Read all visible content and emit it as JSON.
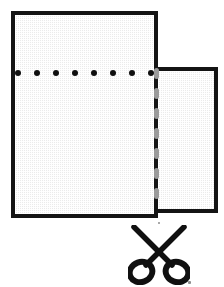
{
  "diagram": {
    "background_color": "#ffffff"
  },
  "sheets": [
    {
      "name": "main-sheet",
      "label": "Main grid sheet",
      "fill_color": "#ebebeb",
      "border_color": "#141414",
      "border_width_px": 4,
      "x": 11,
      "y": 11,
      "width": 147,
      "height": 207
    },
    {
      "name": "tear-off-sheet",
      "label": "Tear-off strip sheet",
      "fill_color": "#ebebeb",
      "border_color": "#141414",
      "border_width_px": 4,
      "x": 158,
      "y": 67,
      "width": 60,
      "height": 146
    }
  ],
  "holes": {
    "name": "punched-hole-row",
    "label": "Row of punched holes",
    "count": 8,
    "color": "#101010",
    "diameter_px": 6,
    "row_y": 73,
    "items": [
      {
        "index": 1,
        "cx": 18
      },
      {
        "index": 2,
        "cx": 37
      },
      {
        "index": 3,
        "cx": 56
      },
      {
        "index": 4,
        "cx": 75
      },
      {
        "index": 5,
        "cx": 94
      },
      {
        "index": 6,
        "cx": 113
      },
      {
        "index": 7,
        "cx": 132
      },
      {
        "index": 8,
        "cx": 151
      }
    ]
  },
  "perforation": {
    "name": "perforation-line",
    "label": "Dashed perforation / tear line",
    "color": "#9a9a9a",
    "orientation": "vertical",
    "x": 157,
    "y_start": 68,
    "y_end": 220,
    "dash_count": 7,
    "dash_width_px": 5,
    "dash_height_px": 11,
    "dash_gap_px": 9
  },
  "scissors": {
    "name": "scissors-icon",
    "label": "Scissors cut indicator",
    "color": "#101010",
    "x": 128,
    "y": 225,
    "width": 62,
    "height": 60
  },
  "specks": [
    {
      "name": "scan-speck-upper",
      "x": 158,
      "y": 222,
      "color": "#8d8d8d"
    },
    {
      "name": "scan-speck-lower-right",
      "x": 188,
      "y": 281,
      "color": "#8d8d8d"
    }
  ]
}
